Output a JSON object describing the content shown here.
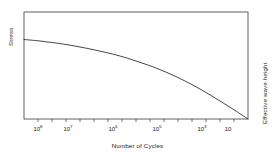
{
  "chart_data": {
    "type": "line",
    "title": "",
    "xlabel": "Number of Cycles",
    "ylabel": "Stress",
    "ylabel_right": "Effective wave height",
    "x_scale": "log",
    "x_reversed": true,
    "grid": false,
    "legend": null,
    "xlim": [
      100000000,
      3
    ],
    "ylim": [
      0,
      1
    ],
    "x_tick_labels": [
      "10⁸",
      "10⁷",
      "10⁶",
      "10⁵",
      "10³",
      "10"
    ],
    "x_ticks": [
      {
        "label_base": "10",
        "label_exp": "8",
        "x_px": 38
      },
      {
        "label_base": "10",
        "label_exp": "7",
        "x_px": 68
      },
      {
        "label_base": "10",
        "label_exp": "6",
        "x_px": 113
      },
      {
        "label_base": "10",
        "label_exp": "5",
        "x_px": 157
      },
      {
        "label_base": "10",
        "label_exp": "3",
        "x_px": 202
      },
      {
        "label_base": "10",
        "label_exp": "",
        "x_px": 228
      }
    ],
    "y_tick_labels": [],
    "series": [
      {
        "name": "S-N fatigue curve",
        "color": "#333333",
        "points": [
          {
            "x": 24,
            "y": 39.5
          },
          {
            "x": 40,
            "y": 41.0
          },
          {
            "x": 56,
            "y": 43.0
          },
          {
            "x": 72,
            "y": 45.5
          },
          {
            "x": 88,
            "y": 48.5
          },
          {
            "x": 104,
            "y": 52.0
          },
          {
            "x": 120,
            "y": 56.0
          },
          {
            "x": 136,
            "y": 61.0
          },
          {
            "x": 152,
            "y": 66.5
          },
          {
            "x": 168,
            "y": 73.0
          },
          {
            "x": 184,
            "y": 80.5
          },
          {
            "x": 200,
            "y": 89.0
          },
          {
            "x": 216,
            "y": 98.5
          },
          {
            "x": 232,
            "y": 108.5
          },
          {
            "x": 248,
            "y": 119.0
          }
        ]
      }
    ],
    "plot_frame": {
      "left": 24,
      "top": 12,
      "right": 248,
      "bottom": 119
    },
    "colors": {
      "background": "#ffffff",
      "axis": "#3a3a3a",
      "curve": "#333333",
      "text": "#1a1a1a"
    }
  },
  "axes": {
    "x_title": "Number of Cycles",
    "y_left_title": "Stress",
    "y_right_title": "Effective wave height"
  }
}
